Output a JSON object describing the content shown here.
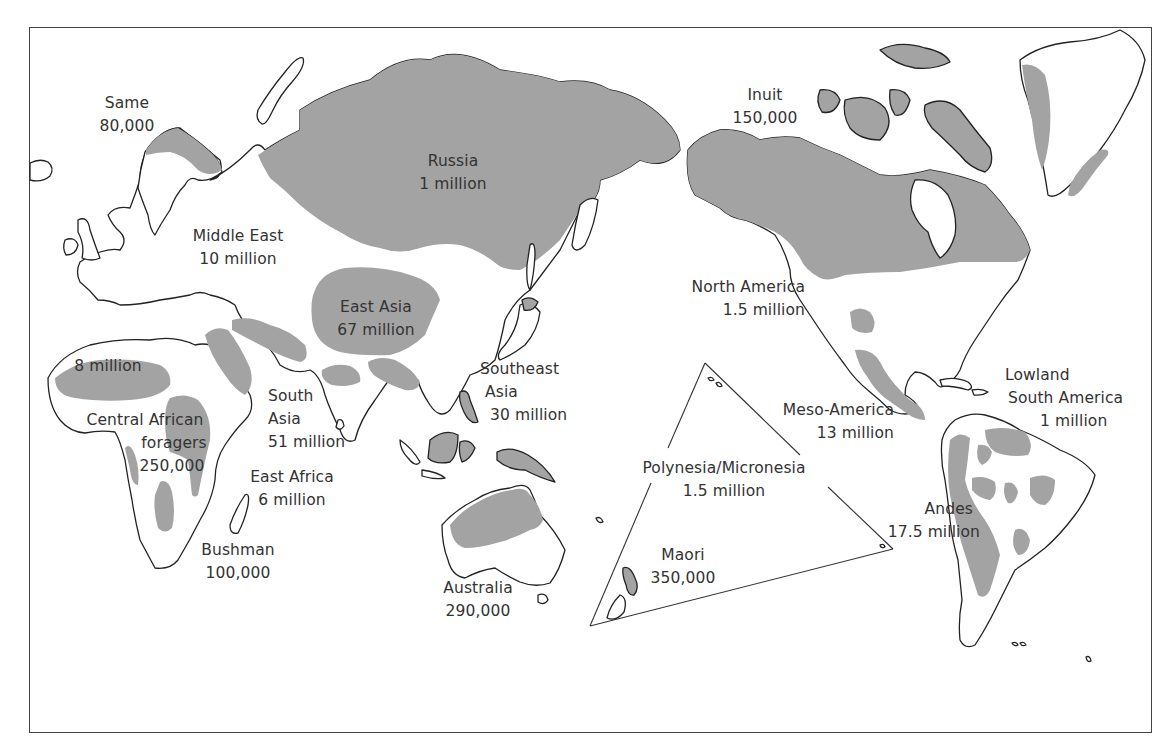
{
  "map": {
    "title": "Indigenous peoples of the world (population estimates)",
    "colors": {
      "shaded_region": "#a3a3a3",
      "outline": "#222222",
      "background": "#ffffff"
    },
    "regions": [
      {
        "name": "Same",
        "population": "80,000"
      },
      {
        "name": "Russia",
        "population": "1 million"
      },
      {
        "name": "Inuit",
        "population": "150,000"
      },
      {
        "name": "Middle East",
        "population": "10 million"
      },
      {
        "name": "East Asia",
        "population": "67 million"
      },
      {
        "name": "North America",
        "population": "1.5 million"
      },
      {
        "name": "Sahel",
        "population": "8 million"
      },
      {
        "name": "Southeast Asia",
        "name_line1": "Southeast",
        "name_line2": "Asia",
        "population": "30 million"
      },
      {
        "name": "South Asia",
        "name_line1": "South",
        "name_line2": "Asia",
        "population": "51 million"
      },
      {
        "name": "Central African foragers",
        "name_line1": "Central African",
        "name_line2": "foragers",
        "population": "250,000"
      },
      {
        "name": "East Africa",
        "population": "6 million"
      },
      {
        "name": "Bushman",
        "population": "100,000"
      },
      {
        "name": "Australia",
        "population": "290,000"
      },
      {
        "name": "Polynesia/Micronesia",
        "population": "1.5 million"
      },
      {
        "name": "Maori",
        "population": "350,000"
      },
      {
        "name": "Meso-America",
        "population": "13 million"
      },
      {
        "name": "Lowland South America",
        "name_line1": "Lowland",
        "name_line2": "South America",
        "population": "1 million"
      },
      {
        "name": "Andes",
        "population": "17.5 million"
      }
    ]
  }
}
